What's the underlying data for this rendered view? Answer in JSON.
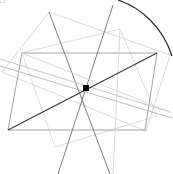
{
  "figure": {
    "width": 173,
    "height": 174,
    "background_color": "#ffffff",
    "corner_glyph": "□",
    "center_marker": {
      "label": "center-point",
      "x": 86,
      "y": 88,
      "size": 6,
      "color": "#000000"
    },
    "colors": {
      "dark_line": "#3a3a3a",
      "mid_line": "#7a7a7a",
      "light_line": "#c8c8c8",
      "very_light_line": "#dcdcdc",
      "arc": "#2e2e2e",
      "marker": "#000000"
    },
    "shapes": [
      {
        "name": "outer-quad-light",
        "kind": "polygon",
        "color": "#d2d2d2",
        "stroke_width": 0.9,
        "points": "2,72 49,12 170,55 146,131"
      },
      {
        "name": "inner-quad-light",
        "kind": "polygon",
        "color": "#d8d8d8",
        "stroke_width": 0.9,
        "points": "22,53 120,29 157,116 55,147"
      },
      {
        "name": "main-rectangle",
        "kind": "polygon",
        "color": "#9a9a9a",
        "stroke_width": 0.9,
        "points": "22,53 157,53 145,130 8,130"
      },
      {
        "name": "star-ray-upper-left",
        "kind": "line",
        "color": "#6e6e6e",
        "stroke_width": 0.9,
        "points": "49,12 110,174"
      },
      {
        "name": "star-ray-upper-right",
        "kind": "line",
        "color": "#6e6e6e",
        "stroke_width": 0.9,
        "points": "113,5 58,174"
      },
      {
        "name": "star-ray-left-long",
        "kind": "line",
        "color": "#b4b4b4",
        "stroke_width": 0.9,
        "points": "0,66 172,118"
      },
      {
        "name": "star-ray-right-long",
        "kind": "line",
        "color": "#c0c0c0",
        "stroke_width": 0.9,
        "points": "0,59 170,112"
      },
      {
        "name": "vertical-faint-line",
        "kind": "line",
        "color": "#d5d5d5",
        "stroke_width": 0.9,
        "points": "120,29 113,174"
      },
      {
        "name": "diagonal-faint-left",
        "kind": "line",
        "color": "#d5d5d5",
        "stroke_width": 0.9,
        "points": "22,53 170,112"
      },
      {
        "name": "main-dark-diagonal",
        "kind": "line",
        "color": "#3a3a3a",
        "stroke_width": 1.2,
        "points": "8,130 157,53"
      },
      {
        "name": "arc-upper-right",
        "kind": "path",
        "color": "#2e2e2e",
        "stroke_width": 1.2,
        "d": "M 118,0 C 142,8 163,28 172,56"
      }
    ]
  }
}
